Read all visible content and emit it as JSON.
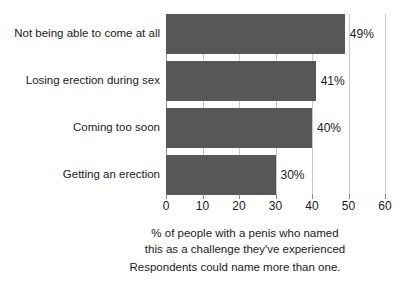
{
  "chart_data": {
    "type": "bar",
    "orientation": "horizontal",
    "categories": [
      "Not being able to come at all",
      "Losing erection during sex",
      "Coming too soon",
      "Getting an erection"
    ],
    "values": [
      49,
      41,
      40,
      30
    ],
    "value_labels": [
      "49%",
      "41%",
      "40%",
      "30%"
    ],
    "title": "",
    "xlabel": "% of people with a penis who named this as a challenge they've experienced",
    "ylabel": "",
    "xlim": [
      0,
      60
    ],
    "xticks": [
      0,
      10,
      20,
      30,
      40,
      50,
      60
    ],
    "xtick_labels": [
      "0",
      "10",
      "20",
      "30",
      "40",
      "50",
      "60"
    ],
    "grid": true,
    "grid_axis": "x",
    "legend": false,
    "bar_color": "#575757",
    "gridline_color": "#c9c9c9",
    "background_color": "#ffffff",
    "text_color": "#1a1a1a"
  },
  "axis_caption": {
    "line1": "% of people with a penis who named",
    "line2": "this as a challenge they've experienced"
  },
  "footnote": {
    "text": "Respondents could name more than one."
  }
}
